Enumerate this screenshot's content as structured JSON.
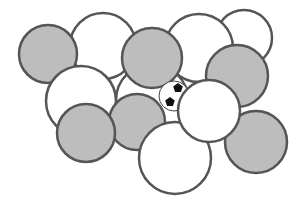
{
  "diagram": {
    "colors": {
      "gray_fill": "#bdbdbd",
      "white_fill": "#ffffff",
      "stroke": "#555555"
    },
    "circles": [
      {
        "id": "white-behind-center",
        "cx": 152,
        "cy": 100,
        "r": 36,
        "fill": "white"
      },
      {
        "id": "white-top-left",
        "cx": 103,
        "cy": 46,
        "r": 33,
        "fill": "white"
      },
      {
        "id": "white-far-top-right",
        "cx": 244,
        "cy": 38,
        "r": 28,
        "fill": "white"
      },
      {
        "id": "white-top-right",
        "cx": 199,
        "cy": 48,
        "r": 34,
        "fill": "white"
      },
      {
        "id": "gray-left-top",
        "cx": 48,
        "cy": 54,
        "r": 29,
        "fill": "gray"
      },
      {
        "id": "white-left-middle",
        "cx": 81,
        "cy": 101,
        "r": 35,
        "fill": "white"
      },
      {
        "id": "gray-right",
        "cx": 237,
        "cy": 76,
        "r": 31,
        "fill": "gray"
      },
      {
        "id": "gray-center-bottom",
        "cx": 137,
        "cy": 122,
        "r": 28,
        "fill": "gray"
      },
      {
        "id": "gray-left-bottom",
        "cx": 86,
        "cy": 133,
        "r": 29,
        "fill": "gray"
      },
      {
        "id": "gray-top-center",
        "cx": 152,
        "cy": 58,
        "r": 30,
        "fill": "gray"
      },
      {
        "id": "gray-far-right",
        "cx": 256,
        "cy": 142,
        "r": 31,
        "fill": "gray"
      },
      {
        "id": "white-bottom",
        "cx": 175,
        "cy": 158,
        "r": 36,
        "fill": "white"
      },
      {
        "id": "white-right-center",
        "cx": 209,
        "cy": 111,
        "r": 31,
        "fill": "white"
      }
    ],
    "ball": {
      "cx": 174,
      "cy": 96,
      "r": 15
    }
  }
}
